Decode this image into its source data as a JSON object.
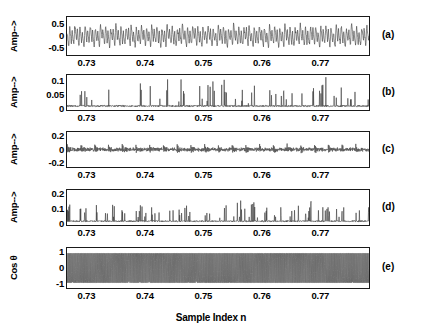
{
  "figure": {
    "xlabel": "Sample Index n",
    "x_tick_labels": [
      "0.73",
      "0.74",
      "0.75",
      "0.76",
      "0.77"
    ],
    "x_tick_values": [
      0.73,
      0.74,
      0.75,
      0.76,
      0.77
    ],
    "xlim": [
      0.7265,
      0.7785
    ],
    "line_color": "#3a3a3a",
    "axis_color": "#1a1a1a"
  },
  "chart_data": {
    "type": "line",
    "title": "",
    "xlabel": "Sample Index n",
    "xlim": [
      0.7265,
      0.7785
    ],
    "grid": false,
    "legend": "none",
    "panels": [
      {
        "letter": "(a)",
        "ylabel": "Amp-->",
        "ylim": [
          -0.85,
          0.85
        ],
        "y_tick_labels": [
          "0.5",
          "0",
          "-0.5"
        ],
        "y_tick_values": [
          0.5,
          0,
          -0.5
        ],
        "description": "quasi-periodic oscillatory vibration signal, amplitude about +/-0.6",
        "signal": {
          "kind": "oscillatory",
          "seed": 11,
          "samples": 1100,
          "base_amp": 0.33,
          "components": [
            {
              "cycles": 118,
              "amp": 0.3
            },
            {
              "cycles": 59,
              "amp": 0.17
            },
            {
              "cycles": 236,
              "amp": 0.09
            },
            {
              "cycles": 23,
              "amp": 0.08
            }
          ],
          "noise": 0.07,
          "burst_cycles": 41,
          "burst_depth": 0.55
        }
      },
      {
        "letter": "(b)",
        "ylabel": "Amp-->",
        "ylim": [
          -0.006,
          0.125
        ],
        "y_tick_labels": [
          "0.1",
          "0.05",
          "0"
        ],
        "y_tick_values": [
          0.1,
          0.05,
          0
        ],
        "description": "rectified envelope spectrum, sparse positive spikes up to 0.1",
        "signal": {
          "kind": "spikes",
          "seed": 27,
          "samples": 1100,
          "baseline": 0.006,
          "noise": 0.006,
          "spike_rate": 0.055,
          "spike_amp": 0.055,
          "spike_max": 0.105,
          "cluster_cycles": 21,
          "cluster_depth": 0.7
        }
      },
      {
        "letter": "(c)",
        "ylabel": "Amp-->",
        "ylim": [
          -0.28,
          0.28
        ],
        "y_tick_labels": [
          "0.2",
          "0",
          "-0.2"
        ],
        "y_tick_values": [
          0.2,
          0,
          -0.2
        ],
        "description": "low amplitude bipolar impulse train with periodic bursts, about +/-0.1",
        "signal": {
          "kind": "impulsive",
          "seed": 43,
          "samples": 1100,
          "noise": 0.018,
          "burst_cycles": 22,
          "burst_depth": 0.82,
          "burst_amp": 0.1,
          "carrier_cycles": 330
        }
      },
      {
        "letter": "(d)",
        "ylabel": "Amp-->",
        "ylim": [
          -0.012,
          0.235
        ],
        "y_tick_labels": [
          "0.2",
          "0.1",
          "0"
        ],
        "y_tick_values": [
          0.2,
          0.1,
          0
        ],
        "description": "rectified envelope, clustered positive spikes mostly below 0.15",
        "signal": {
          "kind": "spikes",
          "seed": 65,
          "samples": 1100,
          "baseline": 0.01,
          "noise": 0.01,
          "spike_rate": 0.085,
          "spike_amp": 0.075,
          "spike_max": 0.175,
          "cluster_cycles": 21,
          "cluster_depth": 0.75
        }
      },
      {
        "letter": "(e)",
        "ylabel": "Cos θ",
        "ylim": [
          -1.35,
          1.35
        ],
        "y_tick_labels": [
          "1",
          "0",
          "-1"
        ],
        "y_tick_values": [
          1,
          0,
          -1
        ],
        "description": "cosine of instantaneous phase, dense full-scale oscillation filling the axes between -1 and 1",
        "signal": {
          "kind": "dense",
          "seed": 87,
          "samples": 2600,
          "amp": 1.0,
          "cycles": 300,
          "jitter": 0.55
        }
      }
    ]
  }
}
